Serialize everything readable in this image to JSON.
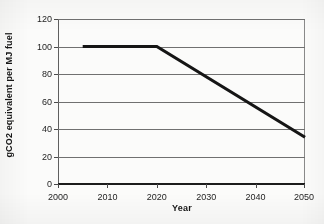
{
  "chart_data": {
    "type": "line",
    "title": "",
    "subtitle": "",
    "xlabel": "Year",
    "ylabel": "gCO2 equivalent per MJ fuel",
    "xlim": [
      2000,
      2050
    ],
    "ylim": [
      0,
      120
    ],
    "xticks": [
      2000,
      2010,
      2020,
      2030,
      2040,
      2050
    ],
    "yticks": [
      0,
      20,
      40,
      60,
      80,
      100,
      120
    ],
    "xtick_labels": [
      "2000",
      "2010",
      "2020",
      "2030",
      "2040",
      "2050"
    ],
    "ytick_labels": [
      "0",
      "20",
      "40",
      "60",
      "80",
      "100",
      "120"
    ],
    "grid": "horizontal",
    "legend": "none",
    "series": [
      {
        "name": "gCO2 equivalent per MJ fuel",
        "color": "#151515",
        "line_width": 3,
        "x": [
          2005,
          2020,
          2050
        ],
        "values": [
          100,
          100,
          34
        ],
        "points": [
          {
            "x": 2005,
            "y": 100
          },
          {
            "x": 2020,
            "y": 100
          },
          {
            "x": 2050,
            "y": 34
          }
        ]
      }
    ],
    "annotations": []
  },
  "figure": {
    "axis_title_x": "Year",
    "axis_title_y": "gCO2 equivalent per MJ fuel"
  }
}
